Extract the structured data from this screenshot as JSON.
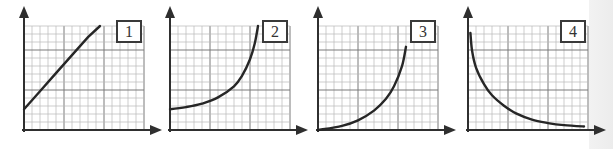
{
  "chart_data": [
    {
      "type": "line",
      "title": "1",
      "xlabel": "",
      "ylabel": "",
      "grid": true,
      "description": "Straight line with positive slope and positive y-intercept",
      "x": [
        0,
        2,
        4,
        6,
        8,
        9.5
      ],
      "y": [
        3,
        5.6,
        8.2,
        10.8,
        13.4,
        15
      ],
      "xlim": [
        0,
        15
      ],
      "ylim": [
        0,
        15
      ]
    },
    {
      "type": "line",
      "title": "2",
      "xlabel": "",
      "ylabel": "",
      "grid": true,
      "description": "Exponential growth curve with positive y-intercept",
      "x": [
        0,
        2,
        4,
        6,
        8,
        9,
        10,
        10.6,
        11
      ],
      "y": [
        3,
        3.3,
        3.8,
        4.7,
        6.3,
        7.8,
        10.2,
        12.5,
        15
      ],
      "xlim": [
        0,
        15
      ],
      "ylim": [
        0,
        15
      ]
    },
    {
      "type": "line",
      "title": "3",
      "xlabel": "",
      "ylabel": "",
      "grid": true,
      "description": "Exponential growth curve starting from origin",
      "x": [
        0,
        3,
        5,
        7,
        8.5,
        9.5,
        10.5,
        11
      ],
      "y": [
        0,
        0.6,
        1.4,
        2.8,
        4.5,
        6.3,
        9.2,
        12
      ],
      "xlim": [
        0,
        15
      ],
      "ylim": [
        0,
        15
      ]
    },
    {
      "type": "line",
      "title": "4",
      "xlabel": "",
      "ylabel": "",
      "grid": true,
      "description": "Decay curve (inverse relationship) approaching x-axis",
      "x": [
        0.3,
        0.5,
        1,
        2,
        3,
        4.5,
        6,
        8,
        10,
        12,
        14.5
      ],
      "y": [
        14,
        11.5,
        9,
        6.6,
        5.0,
        3.5,
        2.4,
        1.5,
        1.0,
        0.7,
        0.5
      ],
      "xlim": [
        0,
        15
      ],
      "ylim": [
        0,
        15
      ]
    }
  ],
  "panels": [
    {
      "label": "1",
      "left": 4
    },
    {
      "label": "2",
      "left": 150
    },
    {
      "label": "3",
      "left": 298
    },
    {
      "label": "4",
      "left": 448
    }
  ],
  "colors": {
    "axis": "#2f2f2f",
    "grid_minor": "#b8b8b8",
    "grid_major": "#7a7a7a",
    "curve": "#262626"
  }
}
